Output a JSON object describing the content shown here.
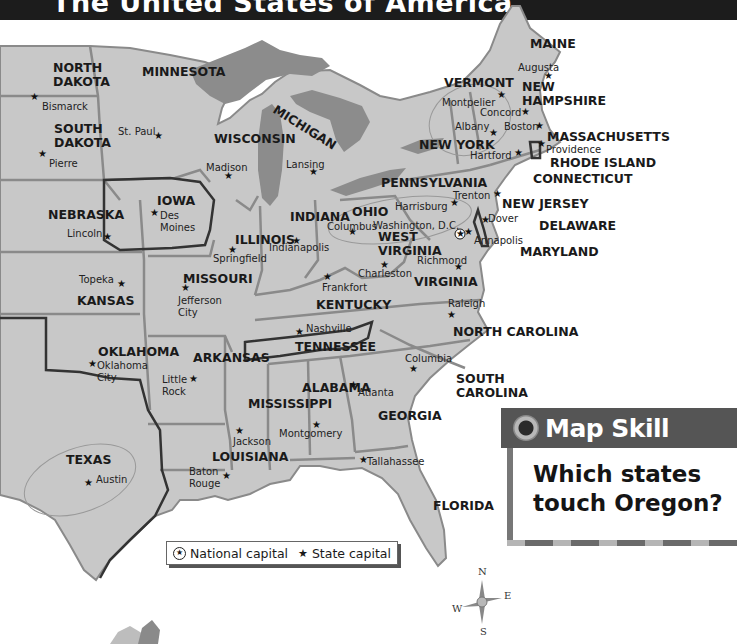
{
  "title": "The United States of America",
  "map": {
    "colors": {
      "land": "#c8c8c8",
      "lake": "#8c8c8c",
      "water": "#ffffff",
      "border": "#8a8a8a",
      "highlight_border": "#333333"
    },
    "states": [
      {
        "name": "MAINE",
        "lines": [
          "MAINE"
        ],
        "x": 530,
        "y": 48
      },
      {
        "name": "VERMONT",
        "lines": [
          "VERMONT"
        ],
        "x": 444,
        "y": 87
      },
      {
        "name": "NEW HAMPSHIRE",
        "lines": [
          "NEW",
          "HAMPSHIRE"
        ],
        "x": 522,
        "y": 91
      },
      {
        "name": "NEW YORK",
        "lines": [
          "NEW YORK"
        ],
        "x": 419,
        "y": 149
      },
      {
        "name": "MASSACHUSETTS",
        "lines": [
          "MASSACHUSETTS"
        ],
        "x": 547,
        "y": 141
      },
      {
        "name": "RHODE ISLAND",
        "lines": [
          "RHODE ISLAND"
        ],
        "x": 550,
        "y": 167
      },
      {
        "name": "CONNECTICUT",
        "lines": [
          "CONNECTICUT"
        ],
        "x": 533,
        "y": 183
      },
      {
        "name": "PENNSYLVANIA",
        "lines": [
          "PENNSYLVANIA"
        ],
        "x": 381,
        "y": 187
      },
      {
        "name": "NEW JERSEY",
        "lines": [
          "NEW JERSEY"
        ],
        "x": 502,
        "y": 208
      },
      {
        "name": "DELAWARE",
        "lines": [
          "DELAWARE"
        ],
        "x": 539,
        "y": 230
      },
      {
        "name": "MARYLAND",
        "lines": [
          "MARYLAND"
        ],
        "x": 520,
        "y": 256
      },
      {
        "name": "WEST VIRGINIA",
        "lines": [
          "WEST",
          "VIRGINIA"
        ],
        "x": 378,
        "y": 241
      },
      {
        "name": "VIRGINIA",
        "lines": [
          "VIRGINIA"
        ],
        "x": 414,
        "y": 286
      },
      {
        "name": "NORTH DAKOTA",
        "lines": [
          "NORTH",
          "DAKOTA"
        ],
        "x": 53,
        "y": 72
      },
      {
        "name": "MINNESOTA",
        "lines": [
          "MINNESOTA"
        ],
        "x": 142,
        "y": 76
      },
      {
        "name": "SOUTH DAKOTA",
        "lines": [
          "SOUTH",
          "DAKOTA"
        ],
        "x": 54,
        "y": 133
      },
      {
        "name": "WISCONSIN",
        "lines": [
          "WISCONSIN"
        ],
        "x": 214,
        "y": 143
      },
      {
        "name": "MICHIGAN",
        "lines": [
          "MICHIGAN"
        ],
        "x": 272,
        "y": 112,
        "curved": true
      },
      {
        "name": "IOWA",
        "lines": [
          "IOWA"
        ],
        "x": 157,
        "y": 205
      },
      {
        "name": "NEBRASKA",
        "lines": [
          "NEBRASKA"
        ],
        "x": 48,
        "y": 219
      },
      {
        "name": "ILLINOIS",
        "lines": [
          "ILLINOIS"
        ],
        "x": 235,
        "y": 244
      },
      {
        "name": "INDIANA",
        "lines": [
          "INDIANA"
        ],
        "x": 290,
        "y": 221
      },
      {
        "name": "OHIO",
        "lines": [
          "OHIO"
        ],
        "x": 352,
        "y": 216
      },
      {
        "name": "KANSAS",
        "lines": [
          "KANSAS"
        ],
        "x": 77,
        "y": 305
      },
      {
        "name": "MISSOURI",
        "lines": [
          "MISSOURI"
        ],
        "x": 183,
        "y": 283
      },
      {
        "name": "KENTUCKY",
        "lines": [
          "KENTUCKY"
        ],
        "x": 316,
        "y": 309
      },
      {
        "name": "TENNESSEE",
        "lines": [
          "TENNESSEE"
        ],
        "x": 295,
        "y": 351
      },
      {
        "name": "NORTH CAROLINA",
        "lines": [
          "NORTH CAROLINA"
        ],
        "x": 453,
        "y": 336
      },
      {
        "name": "OKLAHOMA",
        "lines": [
          "OKLAHOMA"
        ],
        "x": 98,
        "y": 356
      },
      {
        "name": "ARKANSAS",
        "lines": [
          "ARKANSAS"
        ],
        "x": 193,
        "y": 362
      },
      {
        "name": "SOUTH CAROLINA",
        "lines": [
          "SOUTH",
          "CAROLINA"
        ],
        "x": 456,
        "y": 383
      },
      {
        "name": "ALABAMA",
        "lines": [
          "ALABAMA"
        ],
        "x": 302,
        "y": 392
      },
      {
        "name": "MISSISSIPPI",
        "lines": [
          "MISSISSIPPI"
        ],
        "x": 248,
        "y": 408
      },
      {
        "name": "GEORGIA",
        "lines": [
          "GEORGIA"
        ],
        "x": 378,
        "y": 420
      },
      {
        "name": "TEXAS",
        "lines": [
          "TEXAS"
        ],
        "x": 66,
        "y": 464
      },
      {
        "name": "LOUISIANA",
        "lines": [
          "LOUISIANA"
        ],
        "x": 212,
        "y": 461
      },
      {
        "name": "FLORIDA",
        "lines": [
          "FLORIDA"
        ],
        "x": 433,
        "y": 510
      }
    ],
    "capitals": [
      {
        "name": "Augusta",
        "lines": [
          "Augusta"
        ],
        "label_x": 518,
        "label_y": 71,
        "star_x": 548,
        "star_y": 79
      },
      {
        "name": "Montpelier",
        "lines": [
          "Montpelier"
        ],
        "label_x": 442,
        "label_y": 106,
        "star_x": 501,
        "star_y": 98
      },
      {
        "name": "Concord",
        "lines": [
          "Concord"
        ],
        "label_x": 480,
        "label_y": 116,
        "star_x": 525,
        "star_y": 115
      },
      {
        "name": "Albany",
        "lines": [
          "Albany"
        ],
        "label_x": 455,
        "label_y": 130,
        "star_x": 493,
        "star_y": 136
      },
      {
        "name": "Boston",
        "lines": [
          "Boston"
        ],
        "label_x": 504,
        "label_y": 130,
        "star_x": 539,
        "star_y": 129
      },
      {
        "name": "Providence",
        "lines": [
          "Providence"
        ],
        "label_x": 546,
        "label_y": 153,
        "star_x": 541,
        "star_y": 147
      },
      {
        "name": "Hartford",
        "lines": [
          "Hartford"
        ],
        "label_x": 470,
        "label_y": 159,
        "star_x": 518,
        "star_y": 156
      },
      {
        "name": "Trenton",
        "lines": [
          "Trenton"
        ],
        "label_x": 453,
        "label_y": 199,
        "star_x": 497,
        "star_y": 197
      },
      {
        "name": "Harrisburg",
        "lines": [
          "Harrisburg"
        ],
        "label_x": 395,
        "label_y": 210,
        "star_x": 454,
        "star_y": 206
      },
      {
        "name": "Dover",
        "lines": [
          "Dover"
        ],
        "label_x": 488,
        "label_y": 222,
        "star_x": 485,
        "star_y": 223
      },
      {
        "name": "Washington, D.C.",
        "lines": [
          "Washington, D.C."
        ],
        "label_x": 373,
        "label_y": 229,
        "star_x": 460,
        "star_y": 237,
        "national": true
      },
      {
        "name": "Annapolis",
        "lines": [
          "Annapolis"
        ],
        "label_x": 474,
        "label_y": 244,
        "star_x": 468,
        "star_y": 235
      },
      {
        "name": "Richmond",
        "lines": [
          "Richmond"
        ],
        "label_x": 417,
        "label_y": 264,
        "star_x": 458,
        "star_y": 270
      },
      {
        "name": "Charleston",
        "lines": [
          "Charleston"
        ],
        "label_x": 358,
        "label_y": 277,
        "star_x": 384,
        "star_y": 268
      },
      {
        "name": "Columbus",
        "lines": [
          "Columbus"
        ],
        "label_x": 327,
        "label_y": 230,
        "star_x": 352,
        "star_y": 235
      },
      {
        "name": "Frankfort",
        "lines": [
          "Frankfort"
        ],
        "label_x": 322,
        "label_y": 291,
        "star_x": 327,
        "star_y": 280
      },
      {
        "name": "Indianapolis",
        "lines": [
          "Indianapolis"
        ],
        "label_x": 269,
        "label_y": 251,
        "star_x": 296,
        "star_y": 244
      },
      {
        "name": "Springfield",
        "lines": [
          "Springfield"
        ],
        "label_x": 213,
        "label_y": 262,
        "star_x": 232,
        "star_y": 253
      },
      {
        "name": "Nashville",
        "lines": [
          "Nashville"
        ],
        "label_x": 306,
        "label_y": 332,
        "star_x": 299,
        "star_y": 335
      },
      {
        "name": "Raleigh",
        "lines": [
          "Raleigh"
        ],
        "label_x": 448,
        "label_y": 307,
        "star_x": 451,
        "star_y": 318
      },
      {
        "name": "Columbia",
        "lines": [
          "Columbia"
        ],
        "label_x": 405,
        "label_y": 362,
        "star_x": 413,
        "star_y": 372
      },
      {
        "name": "Atlanta",
        "lines": [
          "Atlanta"
        ],
        "label_x": 358,
        "label_y": 396,
        "star_x": 353,
        "star_y": 388
      },
      {
        "name": "Montgomery",
        "lines": [
          "Montgomery"
        ],
        "label_x": 279,
        "label_y": 437,
        "star_x": 316,
        "star_y": 428
      },
      {
        "name": "Jackson",
        "lines": [
          "Jackson"
        ],
        "label_x": 233,
        "label_y": 445,
        "star_x": 239,
        "star_y": 434
      },
      {
        "name": "Tallahassee",
        "lines": [
          "Tallahassee"
        ],
        "label_x": 367,
        "label_y": 465,
        "star_x": 363,
        "star_y": 463
      },
      {
        "name": "Baton Rouge",
        "lines": [
          "Baton",
          "Rouge"
        ],
        "label_x": 189,
        "label_y": 475,
        "star_x": 226,
        "star_y": 479
      },
      {
        "name": "Austin",
        "lines": [
          "Austin"
        ],
        "label_x": 96,
        "label_y": 483,
        "star_x": 88,
        "star_y": 486
      },
      {
        "name": "Little Rock",
        "lines": [
          "Little",
          "Rock"
        ],
        "label_x": 162,
        "label_y": 383,
        "star_x": 193,
        "star_y": 382
      },
      {
        "name": "Oklahoma City",
        "lines": [
          "Oklahoma",
          "City"
        ],
        "label_x": 97,
        "label_y": 369,
        "star_x": 92,
        "star_y": 367
      },
      {
        "name": "Topeka",
        "lines": [
          "Topeka"
        ],
        "label_x": 79,
        "label_y": 283,
        "star_x": 121,
        "star_y": 287
      },
      {
        "name": "Jefferson City",
        "lines": [
          "Jefferson",
          "City"
        ],
        "label_x": 178,
        "label_y": 304,
        "star_x": 185,
        "star_y": 291
      },
      {
        "name": "Lincoln",
        "lines": [
          "Lincoln"
        ],
        "label_x": 67,
        "label_y": 237,
        "star_x": 107,
        "star_y": 240
      },
      {
        "name": "Des Moines",
        "lines": [
          "Des",
          "Moines"
        ],
        "label_x": 160,
        "label_y": 219,
        "star_x": 154,
        "star_y": 216
      },
      {
        "name": "Madison",
        "lines": [
          "Madison"
        ],
        "label_x": 206,
        "label_y": 171,
        "star_x": 228,
        "star_y": 179
      },
      {
        "name": "Lansing",
        "lines": [
          "Lansing"
        ],
        "label_x": 286,
        "label_y": 168,
        "star_x": 313,
        "star_y": 175
      },
      {
        "name": "St. Paul",
        "lines": [
          "St. Paul"
        ],
        "label_x": 118,
        "label_y": 135,
        "star_x": 158,
        "star_y": 139
      },
      {
        "name": "Pierre",
        "lines": [
          "Pierre"
        ],
        "label_x": 49,
        "label_y": 167,
        "star_x": 42,
        "star_y": 157
      },
      {
        "name": "Bismarck",
        "lines": [
          "Bismarck"
        ],
        "label_x": 42,
        "label_y": 110,
        "star_x": 34,
        "star_y": 100
      }
    ]
  },
  "legend": {
    "national_capital_label": "National capital",
    "state_capital_label": "State capital",
    "national_icon": "circled-star-icon",
    "state_icon": "star-icon"
  },
  "map_skill": {
    "header": "Map Skill",
    "question": "Which states touch Oregon?"
  },
  "compass": {
    "n": "N",
    "e": "E",
    "s": "S",
    "w": "W"
  }
}
